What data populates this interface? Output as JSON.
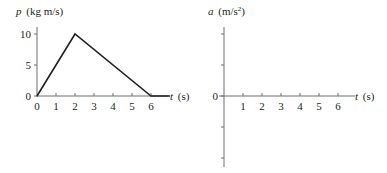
{
  "chart_data": [
    {
      "type": "line",
      "title": "",
      "xlabel": "t (s)",
      "ylabel": "p (kg m/s)",
      "ylabel_var": "p",
      "ylabel_unit": "(kg m/s)",
      "xlabel_var": "t",
      "xlabel_unit": "(s)",
      "x_ticks": [
        "0",
        "1",
        "2",
        "3",
        "4",
        "5",
        "6"
      ],
      "y_ticks": [
        "0",
        "5",
        "10"
      ],
      "xlim": [
        0,
        7
      ],
      "ylim": [
        0,
        10
      ],
      "grid": false,
      "series": [
        {
          "name": "momentum",
          "x": [
            0,
            2,
            6,
            7
          ],
          "y": [
            0,
            10,
            0,
            0
          ]
        }
      ]
    },
    {
      "type": "line",
      "title": "",
      "xlabel": "t (s)",
      "ylabel": "a (m/s²)",
      "ylabel_var": "a",
      "ylabel_unit_pre": "(m/s",
      "ylabel_unit_sup": "2",
      "ylabel_unit_post": ")",
      "xlabel_var": "t",
      "xlabel_unit": "(s)",
      "x_ticks": [
        "1",
        "2",
        "3",
        "4",
        "5",
        "6"
      ],
      "y_ticks": [
        "0"
      ],
      "y_unlabeled_ticks": 4,
      "grid": false,
      "series": []
    }
  ]
}
